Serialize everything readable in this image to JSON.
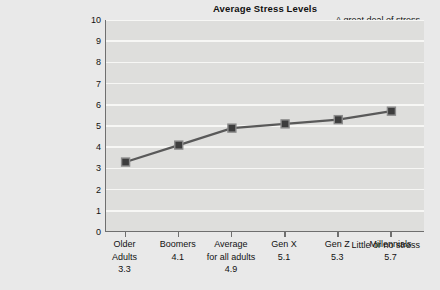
{
  "chart_data": {
    "type": "line",
    "title": "Average Stress Levels",
    "xlabel": "",
    "ylabel": "",
    "ylim": [
      0,
      10
    ],
    "yticks": [
      0,
      1,
      2,
      3,
      4,
      5,
      6,
      7,
      8,
      9,
      10
    ],
    "grid": true,
    "legend": "none",
    "categories": [
      "Older Adults",
      "Boomers",
      "Average for all adults",
      "Gen X",
      "Gen Z",
      "Millennials"
    ],
    "values": [
      3.3,
      4.1,
      4.9,
      5.1,
      5.3,
      5.7
    ],
    "x_labels": [
      {
        "lines": [
          "Older",
          "Adults"
        ],
        "value": "3.3"
      },
      {
        "lines": [
          "Boomers"
        ],
        "value": "4.1"
      },
      {
        "lines": [
          "Average",
          "for all adults"
        ],
        "value": "4.9"
      },
      {
        "lines": [
          "Gen X"
        ],
        "value": "5.1"
      },
      {
        "lines": [
          "Gen Z"
        ],
        "value": "5.3"
      },
      {
        "lines": [
          "Millennials"
        ],
        "value": "5.7"
      }
    ],
    "axis_captions": {
      "y_top": "A great deal of stress",
      "y_bottom": "Little or no stress"
    },
    "colors": {
      "page_background": "#e9e9e9",
      "plot_background": "#dededc",
      "gridline": "#f7f7f5",
      "axis": "#6f6f6f",
      "line": "#595959",
      "marker_fill": "#3d3d3d",
      "marker_edge": "#8c8c8c",
      "text": "#111111"
    }
  }
}
